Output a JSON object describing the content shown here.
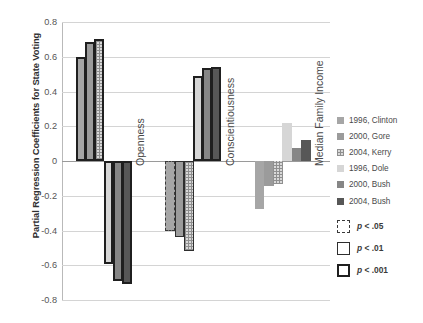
{
  "chart_data": {
    "type": "bar",
    "title": "",
    "xlabel": "",
    "ylabel": "Partial Regression Coefficients for State Voting",
    "ylim": [
      -0.8,
      0.8
    ],
    "ytick_labels": [
      "0.8",
      "0.6",
      "0.4",
      "0.2",
      "0",
      "-0.2",
      "-0.4",
      "-0.6",
      "-0.8"
    ],
    "ytick_values": [
      0.8,
      0.6,
      0.4,
      0.2,
      0,
      -0.2,
      -0.4,
      -0.6,
      -0.8
    ],
    "grid": true,
    "legend_position": "right",
    "categories": [
      "Openness",
      "Conscientiousness",
      "Median Family Income"
    ],
    "series": [
      {
        "name": "1996, Clinton",
        "color": "#a6a6a6",
        "values": [
          0.6,
          -0.4,
          -0.275
        ],
        "significance": [
          "p<.001",
          "p<.05",
          "ns"
        ]
      },
      {
        "name": "2000, Gore",
        "color": "#9b9b9b",
        "values": [
          0.685,
          -0.435,
          -0.145
        ],
        "significance": [
          "p<.001",
          "p<.01",
          "ns"
        ]
      },
      {
        "name": "2004, Kerry",
        "color": "#d9d9d9",
        "values": [
          0.705,
          -0.52,
          -0.13
        ],
        "significance": [
          "p<.001",
          "p<.01",
          "ns"
        ]
      },
      {
        "name": "1996, Dole",
        "color": "#d6d6d6",
        "values": [
          -0.59,
          0.49,
          0.22
        ],
        "significance": [
          "p<.001",
          "p<.001",
          "ns"
        ]
      },
      {
        "name": "2000, Bush",
        "color": "#868686",
        "values": [
          -0.69,
          0.535,
          0.075
        ],
        "significance": [
          "p<.001",
          "p<.001",
          "ns"
        ]
      },
      {
        "name": "2004, Bush",
        "color": "#575757",
        "values": [
          -0.71,
          0.54,
          0.12
        ],
        "significance": [
          "p<.001",
          "p<.001",
          "ns"
        ]
      }
    ],
    "significance_legend": [
      {
        "label": "p < .05",
        "p_symbol": "p",
        "comparator": "<",
        "value": ".05",
        "border_style": "dashed-thin"
      },
      {
        "label": "p < .01",
        "p_symbol": "p",
        "comparator": "<",
        "value": ".01",
        "border_style": "solid-thin"
      },
      {
        "label": "p < .001",
        "p_symbol": "p",
        "comparator": "<",
        "value": ".001",
        "border_style": "solid-thick"
      }
    ]
  },
  "axis": {
    "y_title": "Partial Regression Coefficients for State Voting"
  },
  "legend": {
    "series_labels": [
      "1996, Clinton",
      "2000, Gore",
      "2004, Kerry",
      "1996, Dole",
      "2000, Bush",
      "2004, Bush"
    ],
    "significance_labels": [
      "p < .05",
      "p < .01",
      "p < .001"
    ]
  }
}
